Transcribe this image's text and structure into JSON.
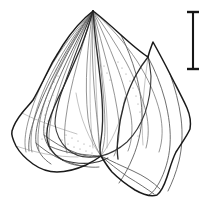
{
  "figure": {
    "kind": "scientific-line-drawing",
    "subject_label": "leaf-specimen-outline",
    "background_color": "#ffffff",
    "ink_color": "#1a1a1a",
    "vein_color": "#6b6b6b",
    "width_px": 210,
    "height_px": 212
  },
  "scale_bar": {
    "name": "scale-bar",
    "orientation": "vertical",
    "style": "i-beam",
    "color": "#161616",
    "x_px": 193,
    "top_px": 12,
    "bottom_px": 69,
    "length_px": 57,
    "cap_half_width_px": 6,
    "label": ""
  },
  "specimen": {
    "name": "leaf-specimen",
    "apex_point": {
      "x": 93,
      "y": 11
    },
    "base_point": {
      "x": 101,
      "y": 156
    },
    "leftmost_point": {
      "x": 12,
      "y": 131
    },
    "rightmost_point": {
      "x": 190,
      "y": 129
    },
    "lowest_point": {
      "x": 157,
      "y": 195
    },
    "outline_path": "M93,11 C100,16 110,25 121,35 C131,44 140,52 148,57 C150,49 152,45 153,42 C158,51 164,62 170,74 C176,86 182,97 187,108 C190,115 191,123 190,129 C187,136 181,144 176,152 C172,160 170,168 167,177 C164,186 161,192 157,195 C150,197 142,194 135,190 C127,185 119,179 112,172 C107,166 104,161 101,156 C97,159 92,162 86,165 C77,169 66,172 57,172 C48,172 40,169 33,164 C26,159 20,153 16,146 C13,140 11,135 12,131 C14,124 18,118 22,113 C26,108 30,104 33,100 C36,95 39,89 43,81 C48,70 55,57 63,45 C72,31 84,18 93,11 Z",
    "fold_paths": [
      "M93,11 C90,22 86,34 81,47 C75,61 69,75 63,88 C57,100 52,111 49,121 C46,131 46,139 49,146 C52,152 57,157 63,160",
      "M93,11 C94,24 95,38 97,52 C99,68 101,84 102,99 C103,113 103,127 101,140 C100,147 99,152 101,156",
      "M148,57 C144,62 140,68 136,75 C131,84 127,94 124,104 C121,115 119,126 118,136 C117,146 117,153 118,159"
    ],
    "inner_margin_paths": [
      "M93,11 C86,26 80,42 74,58 C69,72 64,85 60,97 C57,107 55,116 55,124 C56,133 60,142 67,149 C74,155 84,158 93,157 C97,157 99,156 101,156",
      "M101,156 C110,154 119,149 127,142 C135,134 141,124 145,113 C149,101 151,88 151,76 C150,66 149,60 148,57",
      "M63,160 C72,163 82,164 92,163 C99,162 104,160 108,158"
    ],
    "contour_paths": [
      "M93,11 C83,28 74,46 66,63 C59,78 53,92 49,104 C45,116 43,126 44,135 C46,144 51,152 59,158 C66,163 75,166 85,166",
      "M93,11 C80,30 69,50 60,68 C52,84 45,99 41,112 C37,124 35,134 36,143 C38,152 43,159 51,164",
      "M93,11 C77,32 64,54 54,74 C45,91 38,107 34,120 C30,132 28,142 29,151",
      "M121,35 C127,47 132,60 136,74 C140,89 142,104 142,118 C141,132 138,145 133,157 C129,167 124,176 119,183",
      "M148,57 C155,70 161,85 165,100 C169,116 171,131 170,145 C169,159 165,172 159,183 C155,190 152,193 149,195",
      "M170,74 C175,88 179,103 181,118 C183,134 182,148 179,161 C176,173 172,183 168,191",
      "M101,156 C111,161 122,166 133,171 C144,176 153,182 160,189",
      "M101,156 C109,163 118,170 128,177 C138,183 147,189 154,194",
      "M49,146 C58,150 68,153 79,154 C89,155 97,156 101,156",
      "M44,135 C53,142 63,148 74,152 C84,156 93,158 101,156",
      "M36,143 C45,151 56,158 68,162 C79,166 90,168 99,167"
    ],
    "vein_paths": [
      "M93,11 C90,28 88,46 87,64 C86,82 86,100 88,118 C90,132 94,145 101,156",
      "M93,11 C92,30 92,50 93,70 C94,90 96,110 98,128 C99,140 100,149 101,156",
      "M93,11 C96,30 99,50 101,70 C103,90 105,110 105,128 C105,140 103,149 101,156",
      "M93,11 C98,29 103,48 108,67 C113,86 117,105 119,122 C120,135 118,147 114,156",
      "M93,11 C101,28 109,46 116,64 C123,82 128,100 131,116 C133,129 132,141 128,151",
      "M93,11 C105,27 116,44 126,62 C135,79 142,96 146,112 C149,125 149,137 146,148",
      "M93,11 C110,26 125,43 137,61 C148,78 156,96 160,113 C163,127 163,140 159,152",
      "M93,11 C87,29 82,47 77,65 C72,83 68,101 66,117 C64,131 64,143 67,153",
      "M93,11 C84,28 76,45 69,63 C62,80 56,98 52,114 C49,128 48,140 50,150",
      "M93,11 C81,28 70,46 61,64 C52,81 45,99 41,115 C38,129 37,141 39,151",
      "M93,11 C78,29 65,48 55,67 C45,85 38,103 34,119 C31,132 30,143 32,152",
      "M93,11 C75,30 60,50 49,70 C39,88 32,106 28,122 C25,134 24,144 26,152"
    ],
    "vein_faint_paths": [
      "M93,11 C94,35 95,59 96,83 C97,107 98,129 99,148",
      "M93,11 C91,36 90,61 90,86 C90,110 91,131 93,148",
      "M93,11 C97,36 101,61 104,86 C107,109 108,130 107,148",
      "M101,156 C106,149 111,141 115,132 C120,121 123,109 125,97",
      "M101,156 C95,148 90,139 86,129 C81,117 78,105 76,93",
      "M148,57 C146,72 144,88 143,104 C142,119 142,133 143,145",
      "M22,113 C30,117 39,121 48,124 C58,128 68,131 77,134",
      "M16,146 C25,149 35,152 46,154 C57,156 68,157 78,157"
    ],
    "stipple_dots": [
      {
        "x": 57,
        "y": 54
      },
      {
        "x": 59,
        "y": 60
      },
      {
        "x": 61,
        "y": 66
      },
      {
        "x": 56,
        "y": 70
      },
      {
        "x": 58,
        "y": 76
      },
      {
        "x": 54,
        "y": 82
      },
      {
        "x": 51,
        "y": 88
      },
      {
        "x": 53,
        "y": 95
      },
      {
        "x": 49,
        "y": 101
      },
      {
        "x": 47,
        "y": 108
      },
      {
        "x": 45,
        "y": 115
      },
      {
        "x": 48,
        "y": 121
      },
      {
        "x": 44,
        "y": 127
      },
      {
        "x": 46,
        "y": 133
      },
      {
        "x": 42,
        "y": 139
      },
      {
        "x": 118,
        "y": 62
      },
      {
        "x": 122,
        "y": 68
      },
      {
        "x": 126,
        "y": 74
      },
      {
        "x": 130,
        "y": 81
      },
      {
        "x": 133,
        "y": 88
      },
      {
        "x": 136,
        "y": 96
      },
      {
        "x": 138,
        "y": 104
      },
      {
        "x": 140,
        "y": 112
      },
      {
        "x": 141,
        "y": 120
      },
      {
        "x": 140,
        "y": 128
      },
      {
        "x": 138,
        "y": 136
      },
      {
        "x": 62,
        "y": 140
      },
      {
        "x": 68,
        "y": 144
      },
      {
        "x": 74,
        "y": 147
      },
      {
        "x": 80,
        "y": 149
      },
      {
        "x": 86,
        "y": 151
      },
      {
        "x": 92,
        "y": 153
      },
      {
        "x": 66,
        "y": 135
      },
      {
        "x": 72,
        "y": 138
      },
      {
        "x": 78,
        "y": 141
      },
      {
        "x": 84,
        "y": 144
      },
      {
        "x": 90,
        "y": 146
      },
      {
        "x": 104,
        "y": 66
      },
      {
        "x": 107,
        "y": 73
      },
      {
        "x": 110,
        "y": 80
      }
    ]
  }
}
